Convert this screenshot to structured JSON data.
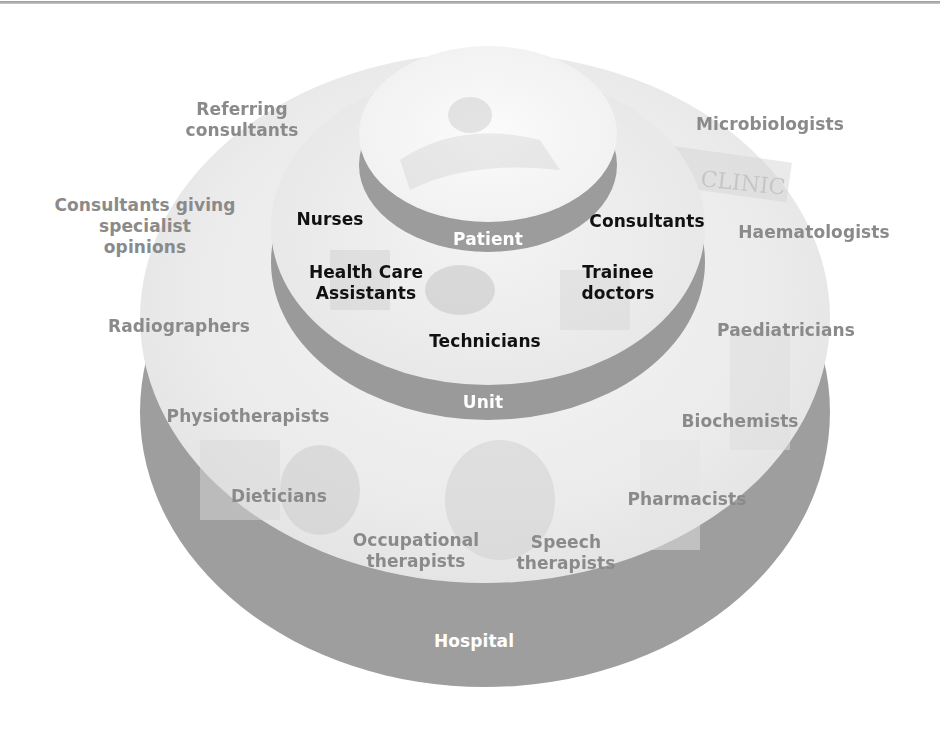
{
  "colors": {
    "band": "#9c9c9c",
    "face_hospital": "#ececec",
    "face_unit": "#f2f2f2",
    "face_patient": "#f7f7f7",
    "outer_text": "#8a8a8a",
    "inner_text": "#111111",
    "tier_text": "#ffffff",
    "rule": "#a8a8a8"
  },
  "tiers": {
    "patient": "Patient",
    "unit": "Unit",
    "hospital": "Hospital"
  },
  "unit_roles": {
    "nurses": "Nurses",
    "consultants": "Consultants",
    "hca_line1": "Health Care",
    "hca_line2": "Assistants",
    "trainee_line1": "Trainee",
    "trainee_line2": "doctors",
    "technicians": "Technicians"
  },
  "hospital_roles": {
    "referring_line1": "Referring",
    "referring_line2": "consultants",
    "microbiologists": "Microbiologists",
    "specialist_line1": "Consultants giving",
    "specialist_line2": "specialist",
    "specialist_line3": "opinions",
    "haematologists": "Haematologists",
    "radiographers": "Radiographers",
    "paediatricians": "Paediatricians",
    "physiotherapists": "Physiotherapists",
    "biochemists": "Biochemists",
    "dieticians": "Dieticians",
    "pharmacists": "Pharmacists",
    "occupational_line1": "Occupational",
    "occupational_line2": "therapists",
    "speech_line1": "Speech",
    "speech_line2": "therapists"
  },
  "background_sign_text": "CLINIC"
}
